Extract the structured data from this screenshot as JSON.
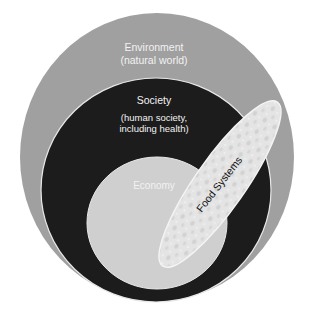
{
  "diagram": {
    "type": "nested-venn",
    "layers": [
      {
        "id": "environment",
        "title": "Environment",
        "subtitle": "(natural world)",
        "color": "#a0a0a0"
      },
      {
        "id": "society",
        "title": "Society",
        "subtitle_line1": "(human society,",
        "subtitle_line2": "including health)",
        "color": "#1c1c1c"
      },
      {
        "id": "economy",
        "title": "Economy",
        "color": "#cfcfcf"
      }
    ],
    "overlay": {
      "id": "food-systems",
      "title": "Food Systems",
      "color": "#e4e4e4",
      "note": "textured ellipse spanning economy, society and environment"
    },
    "colors": {
      "background": "#ffffff",
      "outline": "#e8e8e8",
      "label_light": "#f2f2f2",
      "label_dark": "#111111"
    }
  }
}
